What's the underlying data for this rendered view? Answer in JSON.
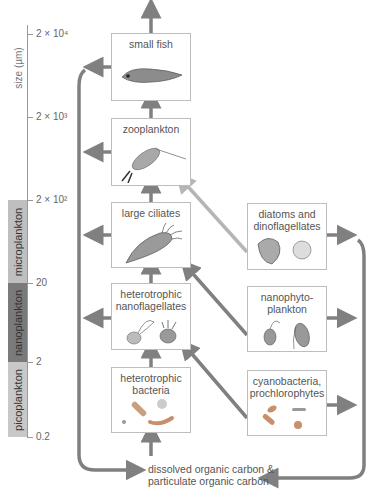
{
  "axis": {
    "label": "size (µm)",
    "ticks": [
      "2 × 10⁴",
      "2 × 10³",
      "2 × 10²",
      "20",
      "2",
      "0.2"
    ]
  },
  "size_classes": [
    {
      "label": "microplankton",
      "color": "#bfbfbf"
    },
    {
      "label": "nanoplankton",
      "color": "#7a7a7a"
    },
    {
      "label": "picoplankton",
      "color": "#c8c8c8"
    }
  ],
  "boxes": {
    "small_fish": "small fish",
    "zooplankton": "zooplankton",
    "large_ciliates": "large ciliates",
    "het_nanoflagellates_1": "heterotrophic",
    "het_nanoflagellates_2": "nanoflagellates",
    "het_bacteria_1": "heterotrophic",
    "het_bacteria_2": "bacteria",
    "diatoms_1": "diatoms and",
    "diatoms_2": "dinoflagellates",
    "nanophyto_1": "nanophyto-",
    "nanophyto_2": "plankton",
    "cyano_1": "cyanobacteria,",
    "cyano_2": "prochlorophytes"
  },
  "carbon_pool": {
    "line1": "dissolved organic carbon &",
    "line2": "particulate organic carbon"
  },
  "colors": {
    "arrow": "#808080",
    "light_arrow": "#b5b5b5",
    "box_border": "#bdbdbd"
  }
}
